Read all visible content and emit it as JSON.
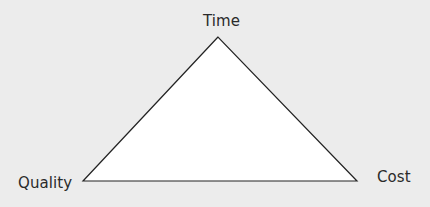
{
  "diagram": {
    "type": "triangle",
    "title": "",
    "vertices": [
      {
        "label": "Time",
        "position": "top"
      },
      {
        "label": "Quality",
        "position": "bottom-left"
      },
      {
        "label": "Cost",
        "position": "bottom-right"
      }
    ],
    "colors": {
      "background": "#ececec",
      "fill": "#ffffff",
      "stroke": "#222222",
      "text": "#2a2a2a"
    }
  }
}
